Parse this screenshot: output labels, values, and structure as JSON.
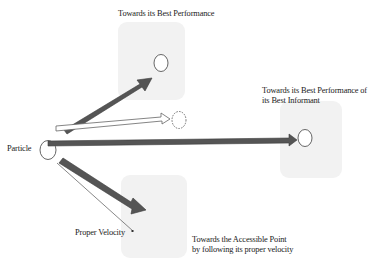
{
  "diagram": {
    "colors": {
      "background": "#ffffff",
      "box_fill": "#f2f2f2",
      "thick_arrow": "#555555",
      "thick_arrow_edge": "#3a3a3a",
      "outline": "#444444",
      "text": "#1a1a1a"
    },
    "nodes": {
      "particle": {
        "label": "Particle",
        "shape": "circle"
      },
      "best_performance": {
        "label": "Towards its Best Performance",
        "shape": "circle-in-rounded-box"
      },
      "best_informant": {
        "label_line1": "Towards its Best Performance of",
        "label_line2": "its Best Informant",
        "shape": "circle-in-rounded-box"
      },
      "accessible_point": {
        "label_line1": "Towards the Accessible Point",
        "label_line2": "by following  its proper velocity",
        "shape": "rounded-box"
      },
      "next_position": {
        "shape": "dashed-circle"
      }
    },
    "edges": [
      {
        "from": "particle",
        "to": "best_performance",
        "style": "thick-dark-arrow"
      },
      {
        "from": "particle",
        "to": "best_informant",
        "style": "thick-dark-arrow"
      },
      {
        "from": "particle",
        "to": "accessible_point",
        "style": "thick-dark-arrow"
      },
      {
        "from": "particle",
        "to": "next_position",
        "style": "hollow-arrow"
      },
      {
        "from": "particle",
        "to": "proper_velocity",
        "style": "thin-line",
        "label": "Proper Velocity"
      }
    ]
  }
}
